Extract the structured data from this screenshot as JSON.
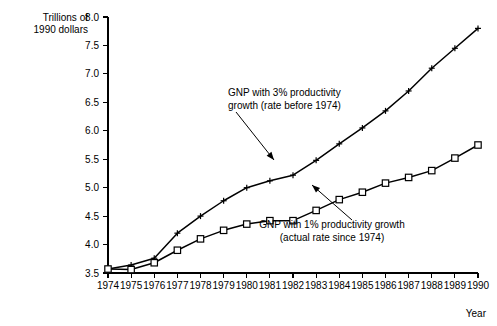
{
  "chart_data": {
    "type": "line",
    "title": "",
    "subtitle": "",
    "xlabel": "Year",
    "ylabel": "Trillions of 1990 dollars",
    "ylabel_line1": "Trillions of",
    "ylabel_line2": "1990 dollars",
    "xlim": [
      1974,
      1990
    ],
    "ylim": [
      3.5,
      8.0
    ],
    "ytick_step": 0.5,
    "grid": false,
    "legend_position": "inline-annotations",
    "categories": [
      1974,
      1975,
      1976,
      1977,
      1978,
      1979,
      1980,
      1981,
      1982,
      1983,
      1984,
      1985,
      1986,
      1987,
      1988,
      1989,
      1990
    ],
    "xtick_labels": [
      "1974",
      "1975",
      "1976",
      "1977",
      "1978",
      "1979",
      "1980",
      "1981",
      "1982",
      "1983",
      "1984",
      "1985",
      "1986",
      "1987",
      "1988",
      "1989",
      "1990"
    ],
    "ytick_labels": [
      "3.5",
      "4.0",
      "4.5",
      "5.0",
      "5.5",
      "6.0",
      "6.5",
      "7.0",
      "7.5",
      "8.0"
    ],
    "ytick_values": [
      3.5,
      4.0,
      4.5,
      5.0,
      5.5,
      6.0,
      6.5,
      7.0,
      7.5,
      8.0
    ],
    "series": [
      {
        "name": "GNP with 3% productivity growth (rate before 1974)",
        "marker": "plus",
        "values": [
          3.57,
          3.64,
          3.76,
          4.2,
          4.5,
          4.77,
          5.0,
          5.12,
          5.22,
          5.48,
          5.77,
          6.05,
          6.35,
          6.7,
          7.1,
          7.45,
          7.8
        ]
      },
      {
        "name": "GNP with 1% productivity growth (actual rate since 1974)",
        "marker": "square",
        "values": [
          3.57,
          3.56,
          3.68,
          3.9,
          4.1,
          4.25,
          4.36,
          4.42,
          4.42,
          4.6,
          4.79,
          4.92,
          5.08,
          5.18,
          5.3,
          5.52,
          5.75
        ]
      }
    ],
    "annotations": [
      {
        "id": "annotation-upper",
        "line1": "GNP with 3% productivity",
        "line2": "growth (rate before 1974)",
        "target_year": 1983,
        "target_value": 5.48
      },
      {
        "id": "annotation-lower",
        "line1": "GNP with 1% productivity growth",
        "line2": "(actual rate since 1974)",
        "target_year": 1986,
        "target_value": 5.08
      }
    ],
    "colors": {
      "line": "#000000",
      "marker_fill": "#ffffff",
      "axis": "#000000",
      "background": "#ffffff"
    }
  }
}
